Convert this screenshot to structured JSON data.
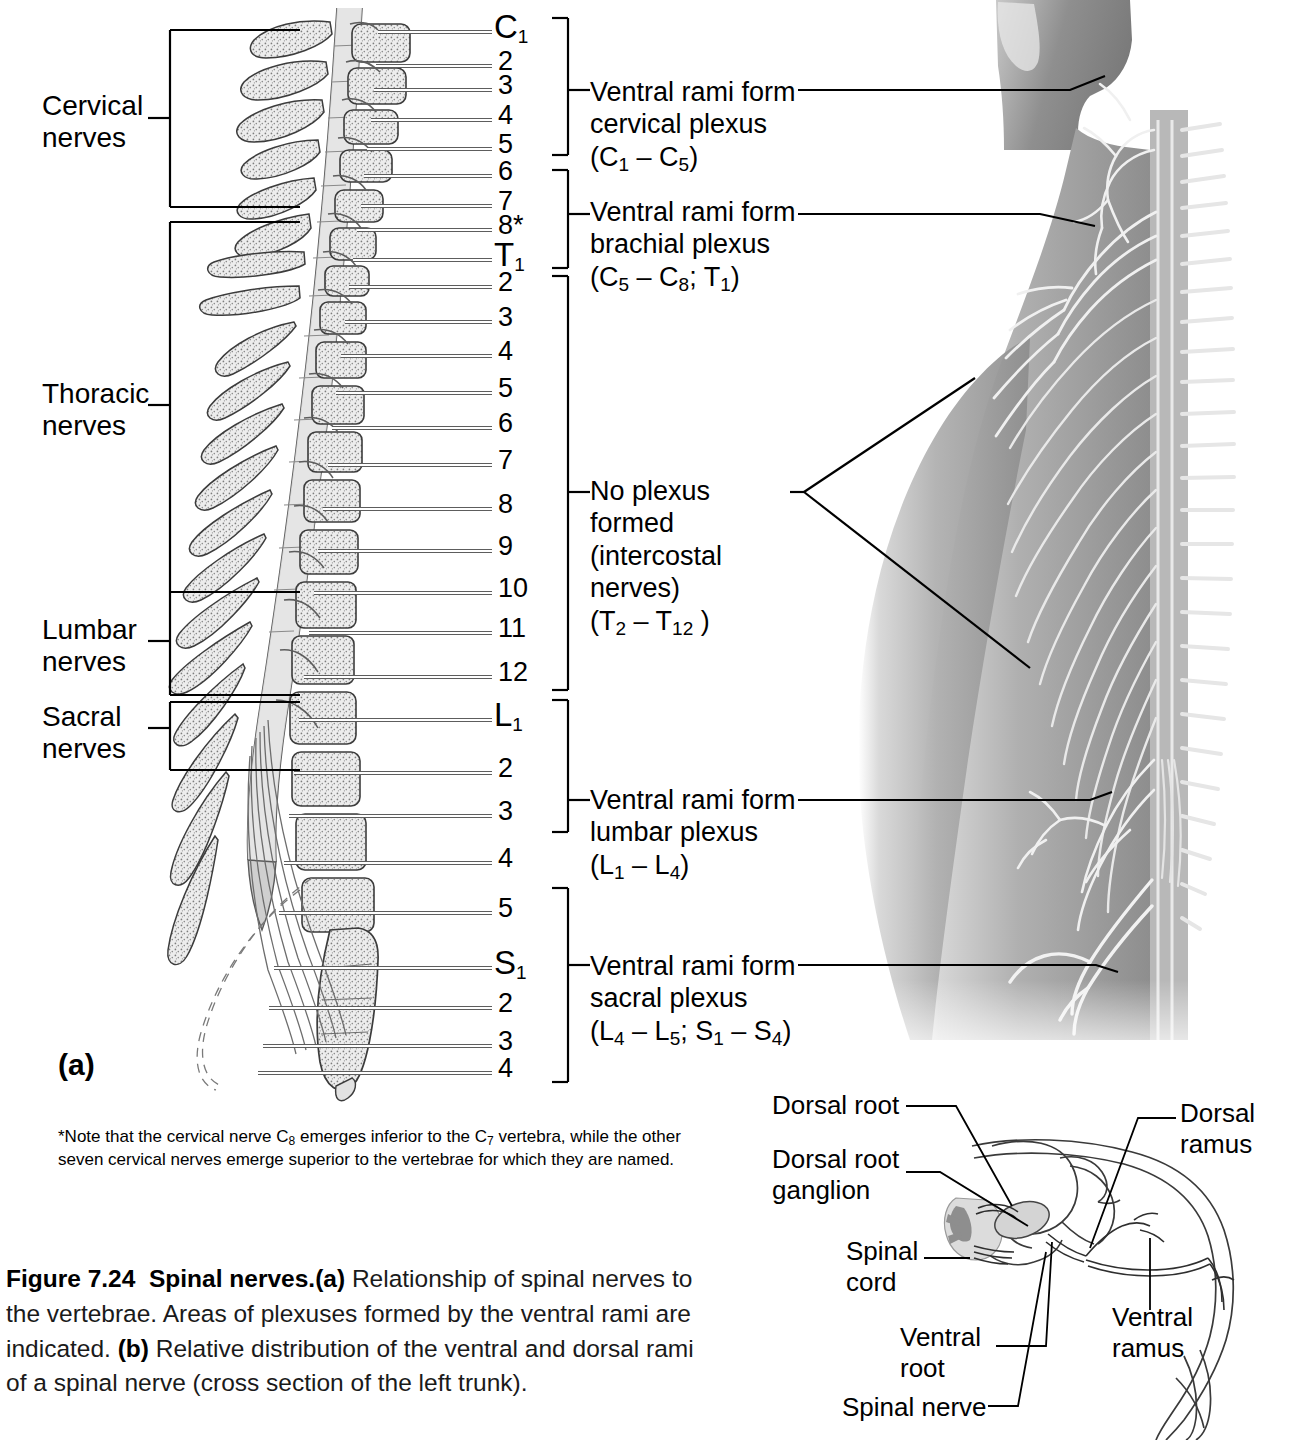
{
  "figure": {
    "number_label": "Figure 7.24",
    "title": "Spinal nerves.",
    "caption_a": "(a)",
    "caption_a_text": " Relationship of spinal nerves to the vertebrae. Areas of plexuses formed by the ventral rami are indicated. ",
    "caption_b": "(b)",
    "caption_b_text": " Relative distribution of the ventral and dorsal rami of a spinal nerve (cross section of the left trunk)."
  },
  "panel_a": {
    "letter": "(a)",
    "region_labels": [
      {
        "line1": "Cervical",
        "line2": "nerves"
      },
      {
        "line1": "Thoracic",
        "line2": "nerves"
      },
      {
        "line1": "Lumbar",
        "line2": "nerves"
      },
      {
        "line1": "Sacral",
        "line2": "nerves"
      }
    ],
    "levels": [
      {
        "prefix": "C",
        "num": "1",
        "y": 30
      },
      {
        "prefix": "",
        "num": "2",
        "y": 64
      },
      {
        "prefix": "",
        "num": "3",
        "y": 88
      },
      {
        "prefix": "",
        "num": "4",
        "y": 118
      },
      {
        "prefix": "",
        "num": "5",
        "y": 147
      },
      {
        "prefix": "",
        "num": "6",
        "y": 174
      },
      {
        "prefix": "",
        "num": "7",
        "y": 204
      },
      {
        "prefix": "",
        "num": "8*",
        "y": 228
      },
      {
        "prefix": "T",
        "num": "1",
        "y": 258
      },
      {
        "prefix": "",
        "num": "2",
        "y": 285
      },
      {
        "prefix": "",
        "num": "3",
        "y": 320
      },
      {
        "prefix": "",
        "num": "4",
        "y": 354
      },
      {
        "prefix": "",
        "num": "5",
        "y": 391
      },
      {
        "prefix": "",
        "num": "6",
        "y": 426
      },
      {
        "prefix": "",
        "num": "7",
        "y": 463
      },
      {
        "prefix": "",
        "num": "8",
        "y": 507
      },
      {
        "prefix": "",
        "num": "9",
        "y": 549
      },
      {
        "prefix": "",
        "num": "10",
        "y": 591
      },
      {
        "prefix": "",
        "num": "11",
        "y": 631
      },
      {
        "prefix": "",
        "num": "12",
        "y": 675
      },
      {
        "prefix": "L",
        "num": "1",
        "y": 718
      },
      {
        "prefix": "",
        "num": "2",
        "y": 771
      },
      {
        "prefix": "",
        "num": "3",
        "y": 814
      },
      {
        "prefix": "",
        "num": "4",
        "y": 861
      },
      {
        "prefix": "",
        "num": "5",
        "y": 911
      },
      {
        "prefix": "S",
        "num": "1",
        "y": 966
      },
      {
        "prefix": "",
        "num": "2",
        "y": 1006
      },
      {
        "prefix": "",
        "num": "3",
        "y": 1044
      },
      {
        "prefix": "",
        "num": "4",
        "y": 1071
      }
    ],
    "plexus_labels": [
      {
        "name": "cervical-plexus",
        "line1": "Ventral rami form",
        "line2": "cervical plexus",
        "line3_pre": "(C",
        "line3_sub1": "1",
        "line3_mid": " – C",
        "line3_sub2": "5",
        "line3_post": ")"
      },
      {
        "name": "brachial-plexus",
        "line1": "Ventral rami form",
        "line2": "brachial plexus",
        "line3_pre": "(C",
        "line3_sub1": "5",
        "line3_mid": " – C",
        "line3_sub2": "8",
        "line3_post": "; T",
        "line3_sub3": "1",
        "line3_end": ")"
      },
      {
        "name": "no-plexus",
        "line1": "No plexus",
        "line2": "formed",
        "line3": "(intercostal",
        "line4": "nerves)",
        "line5_pre": "(T",
        "line5_sub1": "2",
        "line5_mid": " – T",
        "line5_sub2": "12",
        "line5_post": " )"
      },
      {
        "name": "lumbar-plexus",
        "line1": "Ventral rami form",
        "line2": "lumbar plexus",
        "line3_pre": "(L",
        "line3_sub1": "1",
        "line3_mid": " – L",
        "line3_sub2": "4",
        "line3_post": ")"
      },
      {
        "name": "sacral-plexus",
        "line1": "Ventral rami form",
        "line2": "sacral plexus",
        "line3_pre": "(L",
        "line3_sub1": "4",
        "line3_mid": " – L",
        "line3_sub2": "5",
        "line3_post": "; S",
        "line3_sub3": "1",
        "line3_mid2": " – S",
        "line3_sub4": "4",
        "line3_end": ")"
      }
    ],
    "footnote": {
      "part1": "*Note that the cervical nerve C",
      "sub1": "8",
      "part2": " emerges inferior to the C",
      "sub2": "7",
      "part3": " vertebra, while the other",
      "line2": "seven cervical nerves emerge superior to the vertebrae for which they are named."
    }
  },
  "panel_b": {
    "labels": [
      {
        "name": "dorsal-root",
        "line1": "Dorsal root",
        "line2": ""
      },
      {
        "name": "dorsal-root-ganglion",
        "line1": "Dorsal root",
        "line2": "ganglion"
      },
      {
        "name": "spinal-cord",
        "line1": "Spinal",
        "line2": "cord"
      },
      {
        "name": "ventral-root",
        "line1": "Ventral",
        "line2": "root"
      },
      {
        "name": "spinal-nerve",
        "line1": "Spinal nerve",
        "line2": ""
      },
      {
        "name": "dorsal-ramus",
        "line1": "Dorsal",
        "line2": "ramus"
      },
      {
        "name": "ventral-ramus",
        "line1": "Ventral",
        "line2": "ramus"
      }
    ]
  },
  "colors": {
    "ink": "#000000",
    "line_gray": "#4a4a4a",
    "bone_fill": "#e9e9e9",
    "cord_fill": "#d9d9d9",
    "skin_light": "#d0d0d0",
    "skin_mid": "#a9a9a9",
    "skin_dark": "#8a8a8a",
    "nerve_white": "#f2f2f2"
  }
}
